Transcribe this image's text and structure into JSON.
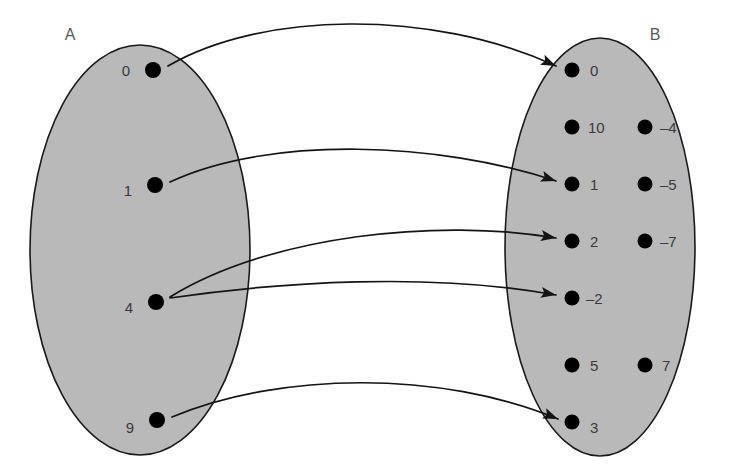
{
  "diagram": {
    "background_color": "#ffffff",
    "set_fill_color": "#b9b9b9",
    "outline_color": "#1a1a1a",
    "dot_color": "#000000",
    "label_color": "#3b3b3b",
    "arrow_color": "#141414"
  },
  "sets": {
    "domain": {
      "name": "A",
      "name_x": 70,
      "name_y": 40,
      "ellipse": {
        "cx": 140,
        "cy": 250,
        "rx": 110,
        "ry": 205
      },
      "elements": [
        {
          "label": "0",
          "dot_x": 153,
          "dot_y": 70,
          "label_x": 130,
          "label_y": 76,
          "label_side": "left"
        },
        {
          "label": "1",
          "dot_x": 155,
          "dot_y": 185,
          "label_x": 132,
          "label_y": 196,
          "label_side": "left"
        },
        {
          "label": "4",
          "dot_x": 156,
          "dot_y": 302,
          "label_x": 133,
          "label_y": 313,
          "label_side": "left"
        },
        {
          "label": "9",
          "dot_x": 157,
          "dot_y": 420,
          "label_x": 134,
          "label_y": 433,
          "label_side": "left"
        }
      ]
    },
    "codomain": {
      "name": "B",
      "name_x": 655,
      "name_y": 40,
      "ellipse": {
        "cx": 600,
        "cy": 247,
        "rx": 95,
        "ry": 209
      },
      "elements": [
        {
          "label": "0",
          "dot_x": 572,
          "dot_y": 70,
          "label_x": 590,
          "label_y": 76,
          "label_side": "right"
        },
        {
          "label": "10",
          "dot_x": 572,
          "dot_y": 127,
          "label_x": 588,
          "label_y": 133,
          "label_side": "right"
        },
        {
          "label": "-4",
          "dot_x": 645,
          "dot_y": 127,
          "label_x": 660,
          "label_y": 133,
          "label_side": "right"
        },
        {
          "label": "1",
          "dot_x": 572,
          "dot_y": 184,
          "label_x": 590,
          "label_y": 190,
          "label_side": "right"
        },
        {
          "label": "-5",
          "dot_x": 645,
          "dot_y": 184,
          "label_x": 660,
          "label_y": 190,
          "label_side": "right"
        },
        {
          "label": "2",
          "dot_x": 572,
          "dot_y": 241,
          "label_x": 590,
          "label_y": 247,
          "label_side": "right"
        },
        {
          "label": "-7",
          "dot_x": 645,
          "dot_y": 241,
          "label_x": 660,
          "label_y": 247,
          "label_side": "right"
        },
        {
          "label": "-2",
          "dot_x": 572,
          "dot_y": 298,
          "label_x": 586,
          "label_y": 304,
          "label_side": "right"
        },
        {
          "label": "5",
          "dot_x": 572,
          "dot_y": 365,
          "label_x": 590,
          "label_y": 371,
          "label_side": "right"
        },
        {
          "label": "7",
          "dot_x": 645,
          "dot_y": 365,
          "label_x": 662,
          "label_y": 371,
          "label_side": "right"
        },
        {
          "label": "3",
          "dot_x": 572,
          "dot_y": 422,
          "label_x": 590,
          "label_y": 433,
          "label_side": "right"
        }
      ]
    }
  },
  "mappings": [
    {
      "from": "0",
      "to": "0",
      "path": "M 168 66 C 260 12 430 8 556 66",
      "head_angle": 30
    },
    {
      "from": "1",
      "to": "1",
      "path": "M 170 182 C 270 135 440 142 556 181",
      "head_angle": 22
    },
    {
      "from": "4",
      "to": "2",
      "path": "M 170 297 C 270 235 440 218 556 238",
      "head_angle": 14
    },
    {
      "from": "4",
      "to": "-2",
      "path": "M 170 298 C 280 282 430 272 556 295",
      "head_angle": 14
    },
    {
      "from": "9",
      "to": "3",
      "path": "M 172 417 C 280 372 440 370 558 419",
      "head_angle": 26
    }
  ],
  "dot_radius_domain": 8,
  "dot_radius_codomain": 7.5
}
